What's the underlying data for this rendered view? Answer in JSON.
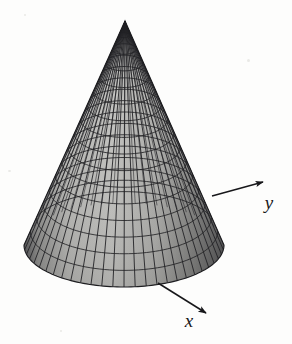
{
  "figure": {
    "title": "",
    "caption": "",
    "background_color": "#fdfdfc",
    "ink_color": "#17171a"
  },
  "axes": {
    "y_axis": {
      "label": "y",
      "arrow_from": [
        212,
        196
      ],
      "arrow_to": [
        263,
        182
      ],
      "label_position": [
        269,
        209
      ]
    },
    "x_axis": {
      "label": "x",
      "arrow_from": [
        158,
        283
      ],
      "arrow_to": [
        206,
        313
      ],
      "label_position": [
        189,
        327
      ]
    }
  },
  "chart_data": {
    "type": "surface",
    "title": "",
    "xlabel": "x",
    "ylabel": "y",
    "zlabel": "",
    "surface": {
      "name": "cone",
      "equation": "z = h - sqrt(x^2 + y^2)",
      "apex": [
        125,
        21
      ],
      "base_center": [
        124,
        245
      ],
      "base_radius_x": 100,
      "base_radius_y": 42,
      "height_px": 224,
      "mesh": {
        "style": "wireframe-diamond",
        "radial_lines": 56,
        "ring_lines": 15,
        "line_color": "#232326",
        "fill_light": "#b9b9b6",
        "fill_dark": "#6e6e6c"
      }
    },
    "legend": [],
    "grid": false
  }
}
